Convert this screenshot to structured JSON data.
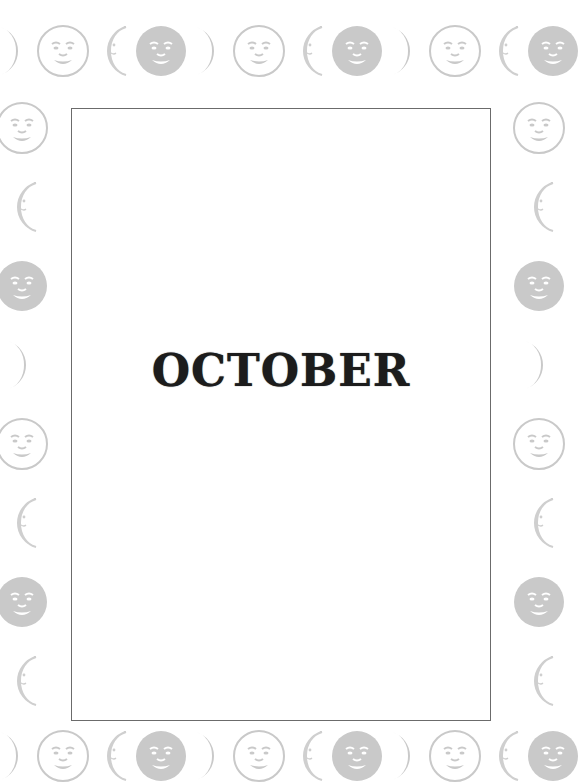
{
  "page": {
    "title": "OCTOBER"
  },
  "border": {
    "color_dark": "#c9c9c9",
    "color_line": "#cfcfcf",
    "top": [
      "crescent-dark-right",
      "face-outline",
      "crescent-light-left",
      "face-dark",
      "crescent-dark-right",
      "face-outline",
      "crescent-light-left",
      "face-dark",
      "crescent-dark-right",
      "face-outline",
      "crescent-light-left",
      "face-dark"
    ],
    "left": [
      "face-outline",
      "crescent-light-left",
      "face-dark",
      "crescent-dark-right",
      "face-outline",
      "crescent-light-left",
      "face-dark",
      "crescent-light-left"
    ],
    "right": [
      "face-outline",
      "crescent-light-left",
      "face-dark",
      "crescent-dark-right",
      "face-outline",
      "crescent-light-left",
      "face-dark",
      "crescent-light-left"
    ],
    "bottom": [
      "crescent-dark-right",
      "face-outline",
      "crescent-light-left",
      "face-dark",
      "crescent-dark-right",
      "face-outline",
      "crescent-light-left",
      "face-dark",
      "crescent-dark-right",
      "face-outline",
      "crescent-light-left",
      "face-dark"
    ]
  }
}
